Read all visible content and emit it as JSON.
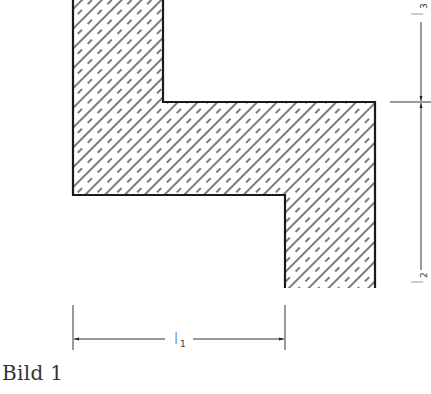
{
  "figure": {
    "caption": "Bild 1",
    "shape": "z-shaped-section",
    "outline_color": "#1a1a1a",
    "hatch_color": "#333333"
  },
  "dimensions": {
    "l1": {
      "symbol": "l",
      "subscript": "1",
      "orientation": "horizontal"
    },
    "l2": {
      "symbol": "l",
      "subscript": "2",
      "orientation": "vertical"
    },
    "l3": {
      "symbol": "l",
      "subscript": "3",
      "orientation": "vertical"
    }
  }
}
